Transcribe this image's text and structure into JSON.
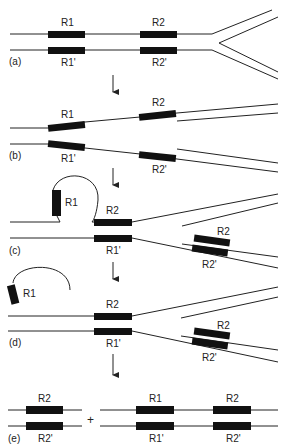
{
  "diagram": {
    "panels": {
      "a": {
        "label": "(a)",
        "repeats": {
          "top": [
            "R1",
            "R2"
          ],
          "bottom": [
            "R1'",
            "R2'"
          ]
        }
      },
      "b": {
        "label": "(b)",
        "repeats": {
          "top": [
            "R1",
            "R2"
          ],
          "bottom": [
            "R1'",
            "R2'"
          ]
        }
      },
      "c": {
        "label": "(c)",
        "loop_repeat": "R1",
        "paired_top": "R2",
        "paired_bottom": "R1'",
        "new_top": "R2",
        "new_bottom": "R2'"
      },
      "d": {
        "label": "(d)",
        "excised_repeat": "R1",
        "paired_top": "R2",
        "paired_bottom": "R1'",
        "new_top": "R2",
        "new_bottom": "R2'"
      },
      "e": {
        "label": "(e)",
        "plus": "+",
        "product1": {
          "top": "R2",
          "bottom": "R2'"
        },
        "product2": {
          "top": [
            "R1",
            "R2"
          ],
          "bottom": [
            "R1'",
            "R2'"
          ]
        }
      }
    },
    "colors": {
      "strand": "#222222",
      "repeat_box": "#111111",
      "background": "#ffffff"
    }
  }
}
